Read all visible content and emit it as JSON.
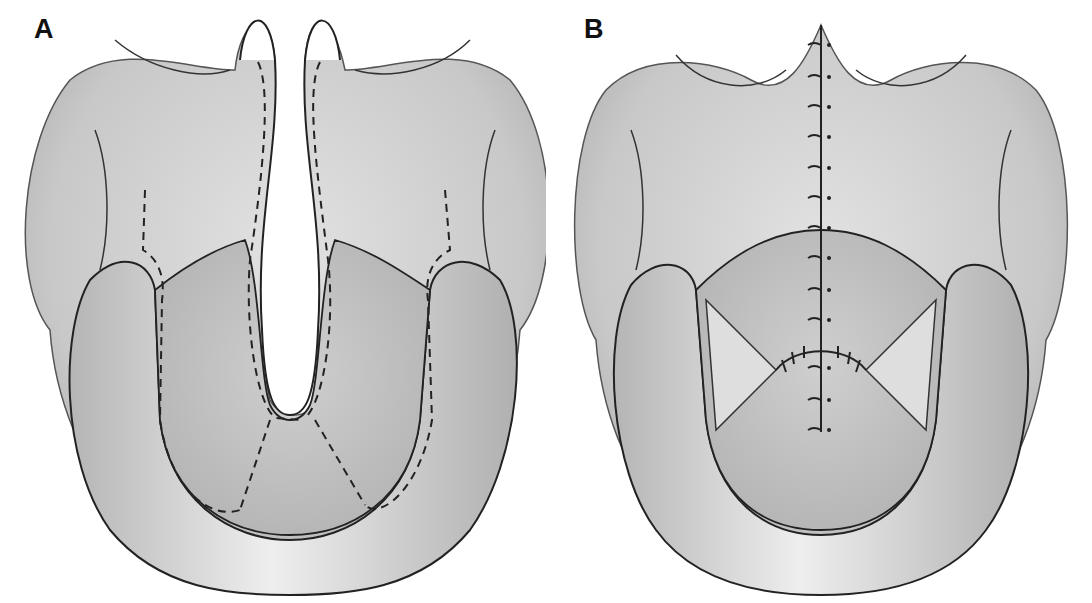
{
  "figure": {
    "panels": [
      {
        "label": "A",
        "description": "Unrepaired cleft palate with dashed incision lines outlining mucoperiosteal flaps"
      },
      {
        "label": "B",
        "description": "Repaired palate with midline sutures and lateral relaxing incisions"
      }
    ]
  },
  "colors": {
    "tissue": "#c9c9c9",
    "tissue_light": "#e6e6e6",
    "tissue_dark": "#9a9a9a",
    "line": "#2a2a2a",
    "background": "#ffffff"
  }
}
